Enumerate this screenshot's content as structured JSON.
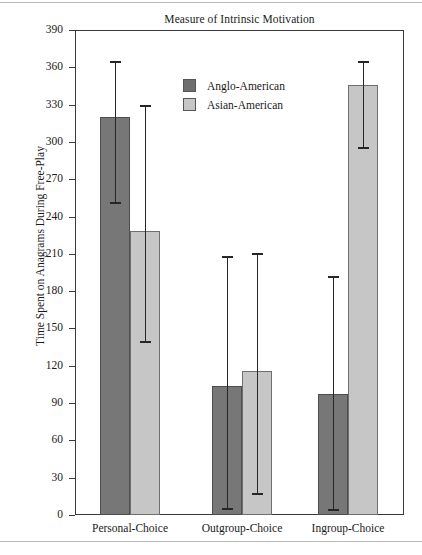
{
  "figure": {
    "title": "Measure of Intrinsic Motivation"
  },
  "chart_data": {
    "type": "bar",
    "title": "Measure of Intrinsic Motivation",
    "xlabel": "",
    "ylabel": "Time Spent on Anagrams During Free-Play",
    "ylim": [
      0,
      390
    ],
    "yticks": [
      0,
      30,
      60,
      90,
      120,
      150,
      180,
      210,
      240,
      270,
      300,
      330,
      360,
      390
    ],
    "ytick_labels": [
      "0",
      "30",
      "60",
      "90",
      "120",
      "150",
      "180",
      "210",
      "240",
      "270",
      "300",
      "330",
      "360",
      "390"
    ],
    "grid": false,
    "legend_position": "upper-center",
    "categories": [
      "Personal-Choice",
      "Outgroup-Choice",
      "Ingroup-Choice"
    ],
    "series": [
      {
        "name": "Anglo-American",
        "color": "#777777",
        "values": [
          320,
          104,
          97
        ],
        "error_low": [
          252,
          6,
          5
        ],
        "error_high": [
          365,
          208,
          192
        ]
      },
      {
        "name": "Asian-American",
        "color": "#c6c6c6",
        "values": [
          228,
          116,
          346
        ],
        "error_low": [
          140,
          18,
          296
        ],
        "error_high": [
          330,
          211,
          365
        ]
      }
    ]
  }
}
